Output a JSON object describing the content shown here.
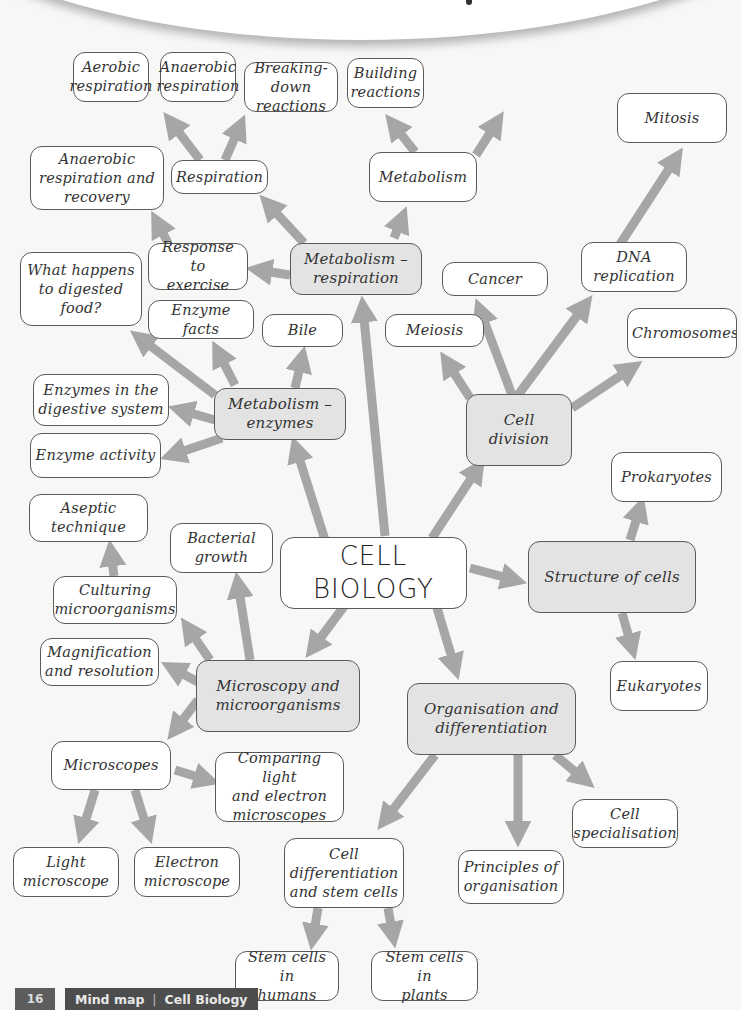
{
  "center": {
    "label": "CELL\nBIOLOGY"
  },
  "hubs": {
    "metabolism_respiration": "Metabolism –\nrespiration",
    "metabolism_enzymes": "Metabolism –\nenzymes",
    "cell_division": "Cell division",
    "structure_of_cells": "Structure of cells",
    "microscopy": "Microscopy and\nmicroorganisms",
    "organisation": "Organisation and\ndifferentiation"
  },
  "nodes": {
    "aerobic_respiration": "Aerobic\nrespiration",
    "anaerobic_respiration": "Anaerobic\nrespiration",
    "breaking_down": "Breaking-down\nreactions",
    "building": "Building\nreactions",
    "mitosis": "Mitosis",
    "anaerobic_recovery": "Anaerobic\nrespiration and\nrecovery",
    "respiration": "Respiration",
    "metabolism": "Metabolism",
    "response_exercise": "Response to\nexercise",
    "digested_food": "What happens\nto digested\nfood?",
    "cancer": "Cancer",
    "dna_replication": "DNA\nreplication",
    "enzyme_facts": "Enzyme facts",
    "bile": "Bile",
    "meiosis": "Meiosis",
    "chromosomes": "Chromosomes",
    "enzymes_digestive": "Enzymes in the\ndigestive system",
    "enzyme_activity": "Enzyme activity",
    "prokaryotes": "Prokaryotes",
    "aseptic": "Aseptic\ntechnique",
    "bacterial_growth": "Bacterial\ngrowth",
    "culturing": "Culturing\nmicroorganisms",
    "magnification": "Magnification\nand resolution",
    "eukaryotes": "Eukaryotes",
    "microscopes": "Microscopes",
    "comparing": "Comparing light\nand electron\nmicroscopes",
    "cell_specialisation": "Cell\nspecialisation",
    "light_microscope": "Light\nmicroscope",
    "electron_microscope": "Electron\nmicroscope",
    "cell_differentiation": "Cell\ndifferentiation\nand stem cells",
    "principles": "Principles of\norganisation",
    "stem_humans": "Stem cells in\nhumans",
    "stem_plants": "Stem cells in\nplants"
  },
  "colors": {
    "arrow": "#a6a6a6",
    "hub_fill": "#e3e3e3",
    "node_fill": "#ffffff",
    "border": "#5a5a5a",
    "footer_bg": "#4d4d4d"
  },
  "footer": {
    "page_number": "16",
    "section": "Mind map",
    "topic": "Cell Biology"
  }
}
